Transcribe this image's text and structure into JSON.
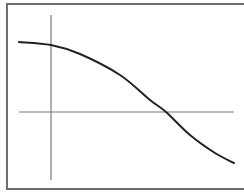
{
  "chart_data": {
    "type": "line",
    "title": "",
    "xlabel": "",
    "ylabel": "",
    "grid": false,
    "legend": null,
    "axes": {
      "origin_px": [
        51,
        112
      ],
      "x_axis_px": {
        "from": 19,
        "to": 234
      },
      "y_axis_px": {
        "from": 15,
        "to": 180
      }
    },
    "series": [
      {
        "name": "curve",
        "description": "decreasing S-shaped (reverse sigmoid) curve, starts high on the left, crosses the horizontal axis right of center, levels off low on the right",
        "points_px": [
          [
            19,
            42
          ],
          [
            51,
            45
          ],
          [
            80,
            54
          ],
          [
            120,
            75
          ],
          [
            150,
            100
          ],
          [
            166,
            112
          ],
          [
            190,
            135
          ],
          [
            215,
            153
          ],
          [
            234,
            163
          ]
        ]
      }
    ],
    "colors": {
      "curve": "#222222",
      "axes": "#7a7a7a",
      "frame": "#6e6e6e"
    }
  }
}
